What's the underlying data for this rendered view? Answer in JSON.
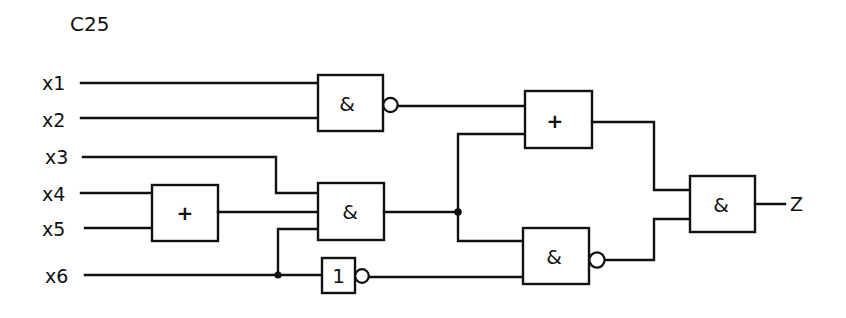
{
  "title": "C25",
  "inputs": [
    {
      "id": "x1",
      "label": "x1"
    },
    {
      "id": "x2",
      "label": "x2"
    },
    {
      "id": "x3",
      "label": "x3"
    },
    {
      "id": "x4",
      "label": "x4"
    },
    {
      "id": "x5",
      "label": "x5"
    },
    {
      "id": "x6",
      "label": "x6"
    }
  ],
  "output": {
    "id": "Z",
    "label": "Z"
  },
  "gates": [
    {
      "id": "g1",
      "type": "NAND",
      "symbol": "&",
      "inputs": [
        "x1",
        "x2"
      ]
    },
    {
      "id": "g2",
      "type": "OR",
      "symbol": "+",
      "inputs": [
        "x4",
        "x5"
      ]
    },
    {
      "id": "g3",
      "type": "AND",
      "symbol": "&",
      "inputs": [
        "x3",
        "g2",
        "x6"
      ]
    },
    {
      "id": "g4",
      "type": "NOT",
      "symbol": "1",
      "inputs": [
        "x6"
      ]
    },
    {
      "id": "g5",
      "type": "OR",
      "symbol": "+",
      "inputs": [
        "g1",
        "g3"
      ]
    },
    {
      "id": "g6",
      "type": "NAND",
      "symbol": "&",
      "inputs": [
        "g3",
        "g4"
      ]
    },
    {
      "id": "g7",
      "type": "AND",
      "symbol": "&",
      "inputs": [
        "g5",
        "g6"
      ]
    }
  ],
  "colors": {
    "line": "#111111",
    "background": "#ffffff"
  }
}
